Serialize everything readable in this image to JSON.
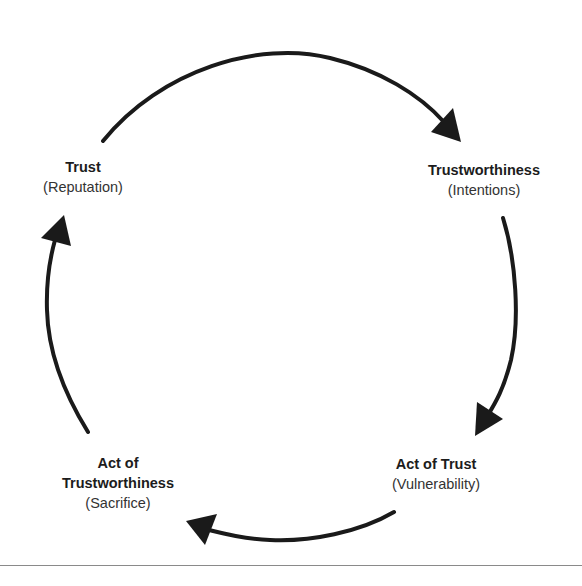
{
  "diagram": {
    "type": "cycle",
    "direction": "clockwise",
    "stroke_color": "#1a1a1a",
    "separator_color": "#8a8a8a",
    "nodes": [
      {
        "id": "trust",
        "title": "Trust",
        "subtitle": "(Reputation)"
      },
      {
        "id": "trustworthiness",
        "title": "Trustworthiness",
        "subtitle": "(Intentions)"
      },
      {
        "id": "act-of-trust",
        "title": "Act of Trust",
        "subtitle": "(Vulnerability)"
      },
      {
        "id": "act-of-trustworthiness",
        "title_line1": "Act of",
        "title_line2": "Trustworthiness",
        "subtitle": "(Sacrifice)"
      }
    ],
    "edges": [
      {
        "from": "trust",
        "to": "trustworthiness"
      },
      {
        "from": "trustworthiness",
        "to": "act-of-trust"
      },
      {
        "from": "act-of-trust",
        "to": "act-of-trustworthiness"
      },
      {
        "from": "act-of-trustworthiness",
        "to": "trust"
      }
    ]
  }
}
